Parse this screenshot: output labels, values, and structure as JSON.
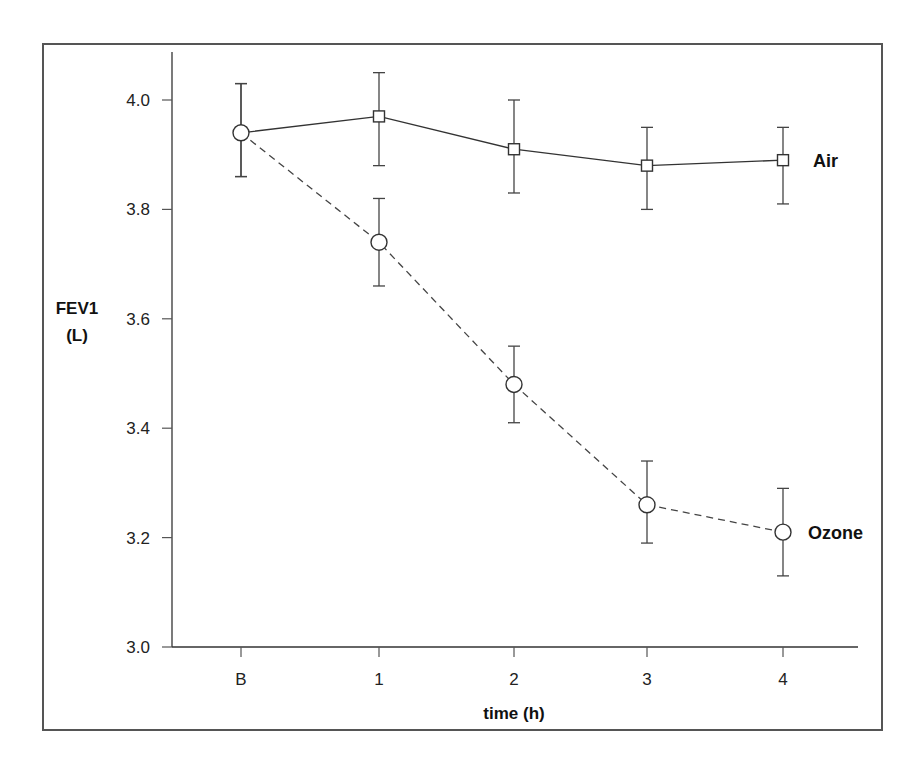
{
  "chart_data": {
    "type": "line",
    "title": "",
    "xlabel": "time (h)",
    "ylabel": "FEV1 (L)",
    "ylabel_lines": [
      "FEV1",
      "(L)"
    ],
    "categories": [
      "B",
      "1",
      "2",
      "3",
      "4"
    ],
    "ylim": [
      3.0,
      4.0
    ],
    "yticks": [
      3.0,
      3.2,
      3.4,
      3.6,
      3.8,
      4.0
    ],
    "ytick_labels": [
      "3.0",
      "3.2",
      "3.4",
      "3.6",
      "3.8",
      "4.0"
    ],
    "grid": false,
    "legend": "direct labels at line ends",
    "series": [
      {
        "name": "Air",
        "marker": "square",
        "line_style": "solid",
        "values": [
          3.94,
          3.97,
          3.91,
          3.88,
          3.89
        ],
        "error_upper": [
          4.03,
          4.05,
          4.0,
          3.95,
          3.95
        ],
        "error_lower": [
          3.86,
          3.88,
          3.83,
          3.8,
          3.81
        ]
      },
      {
        "name": "Ozone",
        "marker": "circle",
        "line_style": "dashed",
        "values": [
          3.94,
          3.74,
          3.48,
          3.26,
          3.21
        ],
        "error_upper": [
          4.03,
          3.82,
          3.55,
          3.34,
          3.29
        ],
        "error_lower": [
          3.86,
          3.66,
          3.41,
          3.19,
          3.13
        ]
      }
    ]
  }
}
